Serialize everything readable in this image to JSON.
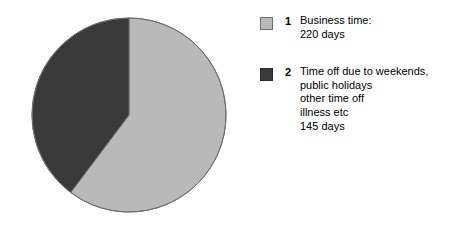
{
  "chart_data": {
    "type": "pie",
    "title": "",
    "subtitle": "",
    "xlabel": "",
    "ylabel": "",
    "total": 365,
    "units": "days",
    "start_angle_deg": 0,
    "direction": "clockwise",
    "grid": false,
    "legend_position": "right",
    "categories": [
      "Business time:",
      "Time off due to weekends, public holidays other time off illness etc"
    ],
    "values": [
      220,
      145
    ],
    "slices": [
      {
        "index": "1",
        "label": "Business time:",
        "value": 220,
        "value_label": "220 days",
        "percent": 60.3,
        "color": "#b9b9b9",
        "edge_color": "#6e6e6e"
      },
      {
        "index": "2",
        "label": "Time off due to weekends, public holidays other time off illness etc",
        "value": 145,
        "value_label": "145 days",
        "percent": 39.7,
        "color": "#3a3a3a",
        "edge_color": "#6e6e6e"
      }
    ]
  },
  "pie": {
    "center_x": 129,
    "center_y": 115,
    "radius": 97,
    "slice1_color": "#b9b9b9",
    "slice2_color": "#3a3a3a",
    "outline_color": "#6e6e6e"
  },
  "legend": {
    "entries": [
      {
        "index": "1",
        "swatch_color": "#b9b9b9",
        "swatch_border": "#6e6e6e",
        "lines": [
          "Business time:",
          "220 days"
        ]
      },
      {
        "index": "2",
        "swatch_color": "#3a3a3a",
        "swatch_border": "#2a2a2a",
        "lines": [
          "Time off due to weekends,",
          "public holidays",
          "other time off",
          "illness etc",
          "145 days"
        ]
      }
    ]
  }
}
